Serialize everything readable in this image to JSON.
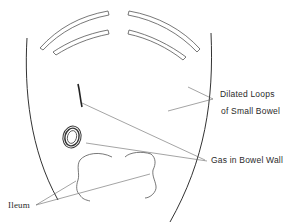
{
  "diagram": {
    "type": "medical-illustration",
    "labels": {
      "dilated_loops_line1": "Dilated Loops",
      "dilated_loops_line2": "of Small Bowel",
      "gas_in_bowel_wall": "Gas in Bowel Wall",
      "ileum": "Ileum"
    },
    "colors": {
      "stroke": "#555555",
      "outline": "#333333",
      "background": "#ffffff"
    }
  }
}
